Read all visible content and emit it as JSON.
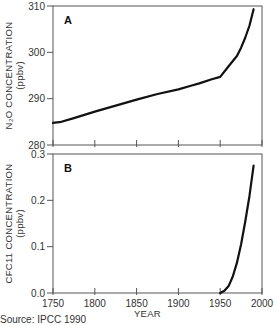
{
  "chart_data": [
    {
      "type": "line",
      "panel_label": "A",
      "title": "",
      "xlabel": "",
      "ylabel": "N2O CONCENTRATION (ppbv)",
      "ylabel_line1": "N₂O CONCENTRATION",
      "ylabel_line2": "(ppbv)",
      "xlim": [
        1750,
        2000
      ],
      "ylim": [
        280,
        310
      ],
      "xticks": [
        1750,
        1800,
        1850,
        1900,
        1950,
        2000
      ],
      "yticks": [
        280,
        290,
        300,
        310
      ],
      "ytick_labels": [
        "280",
        "290",
        "300",
        "310"
      ],
      "grid": false,
      "series": [
        {
          "name": "N2O",
          "x": [
            1750,
            1760,
            1775,
            1800,
            1825,
            1850,
            1875,
            1900,
            1915,
            1925,
            1940,
            1950,
            1960,
            1970,
            1975,
            1980,
            1985,
            1990
          ],
          "y": [
            284.8,
            285.0,
            285.8,
            287.2,
            288.5,
            289.8,
            291.0,
            292.0,
            292.8,
            293.3,
            294.2,
            294.7,
            297.0,
            299.2,
            301.0,
            303.2,
            305.8,
            309.3
          ]
        }
      ]
    },
    {
      "type": "line",
      "panel_label": "B",
      "title": "",
      "xlabel": "YEAR",
      "ylabel": "CFC11 CONCENTRATION (ppbv)",
      "ylabel_line1": "CFC11 CONCENTRATION",
      "ylabel_line2": "(ppbv)",
      "xlim": [
        1750,
        2000
      ],
      "ylim": [
        0.0,
        0.3
      ],
      "xticks": [
        1750,
        1800,
        1850,
        1900,
        1950,
        2000
      ],
      "xtick_labels": [
        "1750",
        "1800",
        "1850",
        "1900",
        "1950",
        "2000"
      ],
      "yticks": [
        0.0,
        0.1,
        0.2,
        0.3
      ],
      "ytick_labels": [
        "0.0",
        "0.1",
        "0.2",
        "0.3"
      ],
      "grid": false,
      "series": [
        {
          "name": "CFC11",
          "x": [
            1950,
            1955,
            1960,
            1965,
            1970,
            1975,
            1980,
            1985,
            1990
          ],
          "y": [
            0.0,
            0.005,
            0.015,
            0.035,
            0.065,
            0.105,
            0.155,
            0.21,
            0.275
          ]
        }
      ]
    }
  ],
  "source": "Source: IPCC 1990"
}
